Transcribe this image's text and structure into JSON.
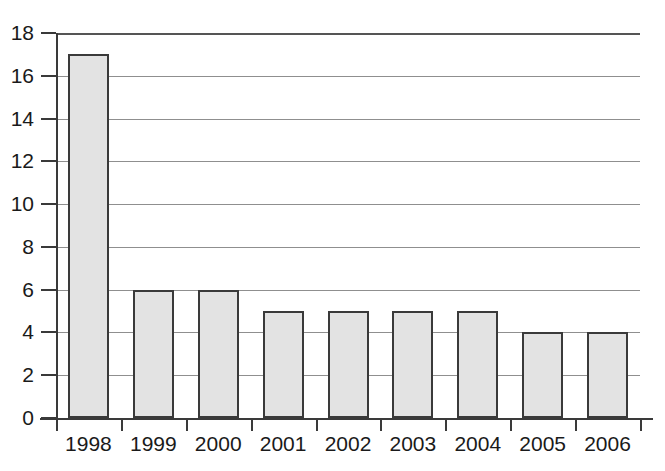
{
  "chart_data": {
    "type": "bar",
    "title": "",
    "xlabel": "",
    "ylabel": "",
    "categories": [
      "1998",
      "1999",
      "2000",
      "2001",
      "2002",
      "2003",
      "2004",
      "2005",
      "2006"
    ],
    "values": [
      17,
      6,
      6,
      5,
      5,
      5,
      5,
      4,
      4
    ],
    "ylim": [
      0,
      18
    ],
    "ytick_step": 2,
    "yticks": [
      "0",
      "2",
      "4",
      "6",
      "8",
      "10",
      "12",
      "14",
      "16",
      "18"
    ],
    "grid": true,
    "grid_axis": "y",
    "legend": "none",
    "colors": {
      "bar_fill": "#e3e3e3",
      "bar_border": "#3a3a3a",
      "gridline": "#8f8f8f",
      "axis": "#3a3a3a",
      "text": "#1a1a1a",
      "background": "#ffffff"
    }
  }
}
